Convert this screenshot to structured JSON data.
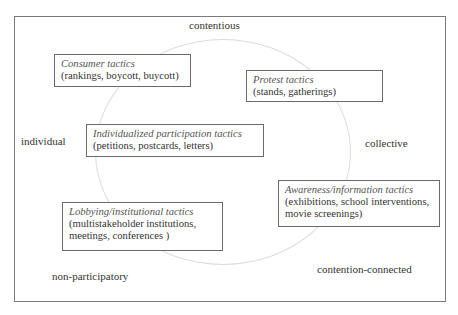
{
  "diagram": {
    "axes": {
      "top": "contentious",
      "left": "individual",
      "right": "collective",
      "bottom_left": "non-participatory",
      "bottom_right": "contention-connected"
    },
    "tactics": [
      {
        "title": "Consumer tactics",
        "examples": "(rankings, boycott, buycott)"
      },
      {
        "title": "Protest tactics",
        "examples": "(stands, gatherings)"
      },
      {
        "title": "Individualized participation tactics",
        "examples": "(petitions,  postcards, letters)"
      },
      {
        "title": "Awareness/information tactics",
        "examples": "(exhibitions, school interventions, movie screenings)"
      },
      {
        "title": "Lobbying/institutional tactics",
        "examples": "(multistakeholder institutions, meetings, conferences )"
      }
    ],
    "colors": {
      "frame_border": "#7a7a7a",
      "box_border": "#6a6a6a",
      "ellipse_stroke": "#dcdcdc",
      "text": "#333333",
      "title_text": "#555555"
    }
  }
}
